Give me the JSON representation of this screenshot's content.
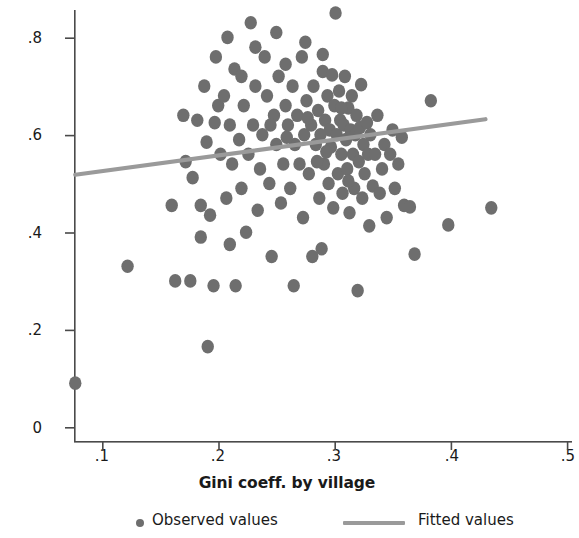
{
  "chart_data": {
    "type": "scatter",
    "title": "",
    "xlabel": "Gini coeff. by village",
    "ylabel": "% of ultra poor HH in the village",
    "xlim": [
      0.07,
      0.5
    ],
    "ylim": [
      0.0,
      0.86
    ],
    "xticks": [
      ".1",
      ".2",
      ".3",
      ".4",
      ".5"
    ],
    "xtick_values": [
      0.1,
      0.2,
      0.3,
      0.4,
      0.5
    ],
    "yticks": [
      "0",
      ".2",
      ".4",
      ".6",
      ".8"
    ],
    "ytick_values": [
      0.0,
      0.2,
      0.4,
      0.6,
      0.8
    ],
    "grid": false,
    "legend_position": "below",
    "marker_color": "#6e6e6e",
    "fit_line_color": "#9a9a9a",
    "axis_color": "#4a4a4a",
    "series": [
      {
        "name": "Observed values",
        "type": "scatter",
        "points": [
          [
            0.077,
            0.09
          ],
          [
            0.122,
            0.33
          ],
          [
            0.16,
            0.455
          ],
          [
            0.163,
            0.3
          ],
          [
            0.17,
            0.64
          ],
          [
            0.172,
            0.545
          ],
          [
            0.176,
            0.3
          ],
          [
            0.178,
            0.512
          ],
          [
            0.182,
            0.63
          ],
          [
            0.185,
            0.455
          ],
          [
            0.188,
            0.7
          ],
          [
            0.19,
            0.585
          ],
          [
            0.191,
            0.165
          ],
          [
            0.193,
            0.435
          ],
          [
            0.196,
            0.29
          ],
          [
            0.198,
            0.76
          ],
          [
            0.2,
            0.66
          ],
          [
            0.202,
            0.56
          ],
          [
            0.205,
            0.68
          ],
          [
            0.207,
            0.47
          ],
          [
            0.208,
            0.8
          ],
          [
            0.21,
            0.62
          ],
          [
            0.212,
            0.54
          ],
          [
            0.214,
            0.735
          ],
          [
            0.215,
            0.29
          ],
          [
            0.218,
            0.59
          ],
          [
            0.22,
            0.49
          ],
          [
            0.222,
            0.66
          ],
          [
            0.224,
            0.4
          ],
          [
            0.226,
            0.56
          ],
          [
            0.228,
            0.83
          ],
          [
            0.23,
            0.62
          ],
          [
            0.232,
            0.7
          ],
          [
            0.234,
            0.445
          ],
          [
            0.236,
            0.53
          ],
          [
            0.238,
            0.6
          ],
          [
            0.24,
            0.76
          ],
          [
            0.242,
            0.68
          ],
          [
            0.244,
            0.5
          ],
          [
            0.246,
            0.35
          ],
          [
            0.248,
            0.64
          ],
          [
            0.25,
            0.58
          ],
          [
            0.252,
            0.72
          ],
          [
            0.254,
            0.46
          ],
          [
            0.256,
            0.54
          ],
          [
            0.258,
            0.66
          ],
          [
            0.26,
            0.62
          ],
          [
            0.262,
            0.49
          ],
          [
            0.264,
            0.7
          ],
          [
            0.265,
            0.29
          ],
          [
            0.266,
            0.58
          ],
          [
            0.268,
            0.64
          ],
          [
            0.27,
            0.54
          ],
          [
            0.272,
            0.76
          ],
          [
            0.273,
            0.43
          ],
          [
            0.274,
            0.6
          ],
          [
            0.276,
            0.67
          ],
          [
            0.278,
            0.52
          ],
          [
            0.28,
            0.62
          ],
          [
            0.281,
            0.35
          ],
          [
            0.282,
            0.7
          ],
          [
            0.284,
            0.58
          ],
          [
            0.286,
            0.65
          ],
          [
            0.287,
            0.47
          ],
          [
            0.288,
            0.6
          ],
          [
            0.289,
            0.366
          ],
          [
            0.29,
            0.73
          ],
          [
            0.291,
            0.54
          ],
          [
            0.292,
            0.63
          ],
          [
            0.294,
            0.68
          ],
          [
            0.295,
            0.5
          ],
          [
            0.296,
            0.61
          ],
          [
            0.297,
            0.575
          ],
          [
            0.298,
            0.723
          ],
          [
            0.299,
            0.45
          ],
          [
            0.3,
            0.66
          ],
          [
            0.301,
            0.85
          ],
          [
            0.302,
            0.6
          ],
          [
            0.303,
            0.52
          ],
          [
            0.304,
            0.69
          ],
          [
            0.305,
            0.63
          ],
          [
            0.306,
            0.56
          ],
          [
            0.307,
            0.48
          ],
          [
            0.308,
            0.62
          ],
          [
            0.309,
            0.72
          ],
          [
            0.31,
            0.59
          ],
          [
            0.311,
            0.53
          ],
          [
            0.312,
            0.655
          ],
          [
            0.313,
            0.44
          ],
          [
            0.314,
            0.61
          ],
          [
            0.315,
            0.68
          ],
          [
            0.316,
            0.56
          ],
          [
            0.317,
            0.49
          ],
          [
            0.318,
            0.6
          ],
          [
            0.319,
            0.64
          ],
          [
            0.32,
            0.28
          ],
          [
            0.321,
            0.545
          ],
          [
            0.322,
            0.615
          ],
          [
            0.323,
            0.703
          ],
          [
            0.324,
            0.47
          ],
          [
            0.325,
            0.58
          ],
          [
            0.326,
            0.52
          ],
          [
            0.328,
            0.625
          ],
          [
            0.329,
            0.56
          ],
          [
            0.33,
            0.413
          ],
          [
            0.331,
            0.6
          ],
          [
            0.333,
            0.495
          ],
          [
            0.335,
            0.56
          ],
          [
            0.337,
            0.64
          ],
          [
            0.339,
            0.48
          ],
          [
            0.341,
            0.53
          ],
          [
            0.343,
            0.58
          ],
          [
            0.345,
            0.43
          ],
          [
            0.348,
            0.56
          ],
          [
            0.35,
            0.61
          ],
          [
            0.352,
            0.49
          ],
          [
            0.355,
            0.54
          ],
          [
            0.358,
            0.595
          ],
          [
            0.36,
            0.455
          ],
          [
            0.365,
            0.452
          ],
          [
            0.369,
            0.355
          ],
          [
            0.383,
            0.67
          ],
          [
            0.398,
            0.415
          ],
          [
            0.435,
            0.45
          ],
          [
            0.21,
            0.375
          ],
          [
            0.245,
            0.62
          ],
          [
            0.259,
            0.595
          ],
          [
            0.277,
            0.635
          ],
          [
            0.285,
            0.545
          ],
          [
            0.293,
            0.565
          ],
          [
            0.306,
            0.655
          ],
          [
            0.312,
            0.505
          ],
          [
            0.22,
            0.72
          ],
          [
            0.232,
            0.78
          ],
          [
            0.25,
            0.81
          ],
          [
            0.258,
            0.745
          ],
          [
            0.275,
            0.79
          ],
          [
            0.29,
            0.765
          ],
          [
            0.197,
            0.625
          ],
          [
            0.185,
            0.39
          ]
        ]
      },
      {
        "name": "Fitted values",
        "type": "line",
        "points": [
          [
            0.077,
            0.518
          ],
          [
            0.43,
            0.632
          ]
        ]
      }
    ],
    "legend": [
      {
        "label": "Observed values",
        "marker": "dot",
        "color": "#6e6e6e"
      },
      {
        "label": "Fitted values",
        "marker": "line",
        "color": "#9a9a9a"
      }
    ]
  }
}
